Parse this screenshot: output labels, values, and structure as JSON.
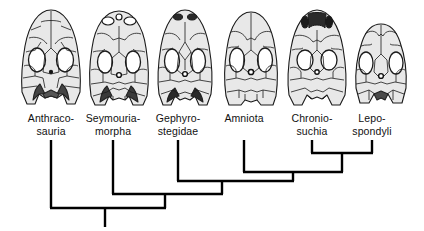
{
  "figure": {
    "type": "cladogram",
    "width": 424,
    "height": 231,
    "background_color": "#ffffff",
    "line_color": "#000000",
    "skull_fill_color": "#e8e8e8",
    "skull_outline_color": "#1a1a1a",
    "skull_shadow_color": "#3a3a3a"
  },
  "taxa": [
    {
      "id": "anthracosauria",
      "label": "Anthraco-\nsauria",
      "label_lines": [
        "Anthraco-",
        "sauria"
      ],
      "skull_name": "anthracosauria-skull",
      "tip_x": 51,
      "label_x": 11,
      "skull_x": 15
    },
    {
      "id": "seymouriamorpha",
      "label": "Seymouria-\nmorpha",
      "label_lines": [
        "Seymouria-",
        "morpha"
      ],
      "skull_name": "seymouriamorpha-skull",
      "tip_x": 113,
      "label_x": 73,
      "skull_x": 83
    },
    {
      "id": "gephyrostegidae",
      "label": "Gephyro-\nstegidae",
      "label_lines": [
        "Gephyro-",
        "stegidae"
      ],
      "skull_name": "gephyrostegidae-skull",
      "tip_x": 178,
      "label_x": 138,
      "skull_x": 149
    },
    {
      "id": "amniota",
      "label": "Amniota",
      "label_lines": [
        "Amniota"
      ],
      "skull_name": "amniota-skull",
      "tip_x": 244,
      "label_x": 204,
      "skull_x": 215
    },
    {
      "id": "chroniosuchia",
      "label": "Chronio-\nsuchia",
      "label_lines": [
        "Chronio-",
        "suchia"
      ],
      "skull_name": "chroniosuchia-skull",
      "tip_x": 312,
      "label_x": 272,
      "skull_x": 281
    },
    {
      "id": "lepospondyli",
      "label": "Lepo-\nspondyli",
      "label_lines": [
        "Lepo-",
        "spondyli"
      ],
      "skull_name": "lepospondyli-skull",
      "tip_x": 372,
      "label_x": 332,
      "skull_x": 345
    }
  ],
  "tree": {
    "label_top_y": 112,
    "tip_start_y": 140,
    "root_x": 105,
    "root_bottom_y": 227,
    "nodes": [
      {
        "id": "node-chroniosuchia-lepospondyli",
        "children": [
          "chroniosuchia",
          "lepospondyli"
        ],
        "join_y": 153,
        "stem_x": 342,
        "stem_bottom_y": 172
      },
      {
        "id": "node-amniota-clade",
        "children": [
          "amniota",
          "node-chroniosuchia-lepospondyli"
        ],
        "join_y": 172,
        "stem_x": 293,
        "stem_bottom_y": 181
      },
      {
        "id": "node-gephyrostegidae-clade",
        "children": [
          "gephyrostegidae",
          "node-amniota-clade"
        ],
        "join_y": 181,
        "stem_x": 222,
        "stem_bottom_y": 194
      },
      {
        "id": "node-seymouriamorpha-clade",
        "children": [
          "seymouriamorpha",
          "node-gephyrostegidae-clade"
        ],
        "join_y": 194,
        "stem_x": 165,
        "stem_bottom_y": 208
      },
      {
        "id": "node-root",
        "children": [
          "anthracosauria",
          "node-seymouriamorpha-clade"
        ],
        "join_y": 208,
        "stem_x": 105,
        "stem_bottom_y": 227
      }
    ]
  }
}
